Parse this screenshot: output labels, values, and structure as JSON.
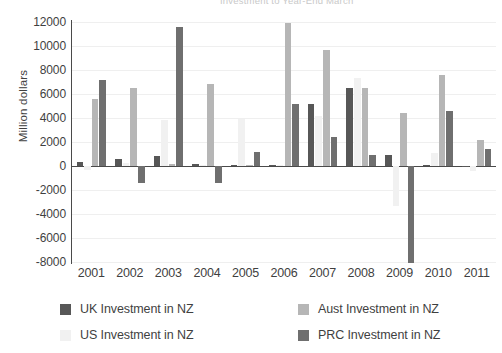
{
  "chart_data": {
    "type": "bar",
    "title": "Investment to Year-End March",
    "xlabel": "",
    "ylabel": "Million dollars",
    "ylim": [
      -8000,
      12000
    ],
    "ytick_step": 2000,
    "yticks": [
      12000,
      10000,
      8000,
      6000,
      4000,
      2000,
      0,
      -2000,
      -4000,
      -6000,
      -8000
    ],
    "grid": true,
    "legend_position": "bottom",
    "categories": [
      "2001",
      "2002",
      "2003",
      "2004",
      "2005",
      "2006",
      "2007",
      "2008",
      "2009",
      "2010",
      "2011"
    ],
    "series": [
      {
        "name": "UK Investment in NZ",
        "color": "#575757",
        "values": [
          300,
          600,
          800,
          150,
          60,
          60,
          5200,
          6500,
          900,
          60,
          40
        ]
      },
      {
        "name": "US Investment in NZ",
        "color": "#f1f1f1",
        "values": [
          -350,
          250,
          3800,
          100,
          3900,
          100,
          4200,
          7300,
          -3300,
          1100,
          -400
        ]
      },
      {
        "name": "Aust Investment in NZ",
        "color": "#b6b6b6",
        "values": [
          5600,
          6500,
          150,
          6800,
          80,
          11900,
          9700,
          6500,
          4400,
          7600,
          2200
        ]
      },
      {
        "name": "PRC Investment in NZ",
        "color": "#6f6f6f",
        "values": [
          7200,
          -1400,
          11600,
          -1400,
          1200,
          5200,
          2400,
          900,
          -8100,
          4600,
          1400
        ]
      }
    ]
  },
  "legend": {
    "items": [
      {
        "label": "UK Investment in NZ",
        "color": "#575757"
      },
      {
        "label": "Aust Investment in NZ",
        "color": "#b6b6b6"
      },
      {
        "label": "US Investment in NZ",
        "color": "#f1f1f1"
      },
      {
        "label": "PRC Investment in NZ",
        "color": "#6f6f6f"
      }
    ]
  }
}
